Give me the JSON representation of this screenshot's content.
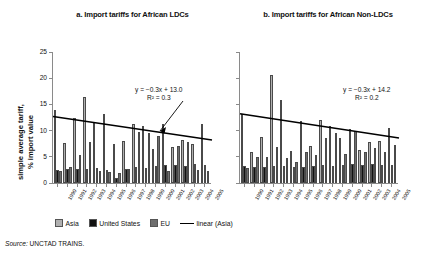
{
  "figure": {
    "ylabel": "simple average tariff,\n% import value",
    "ylabel_line1": "simple average tariff,",
    "ylabel_line2": "% import value",
    "source_prefix": "Source:",
    "source_text": "UNCTAD TRAINS."
  },
  "legend": {
    "items": [
      {
        "label": "Asia",
        "color": "#b0b0b0",
        "type": "swatch",
        "name": "legend-asia"
      },
      {
        "label": "United States",
        "color": "#111111",
        "type": "swatch",
        "name": "legend-united-states"
      },
      {
        "label": "EU",
        "color": "#6e6e6e",
        "type": "swatch",
        "name": "legend-eu"
      },
      {
        "label": "linear (Asia)",
        "color": "#000000",
        "type": "line",
        "name": "legend-linear-asia"
      }
    ]
  },
  "chart_data": [
    {
      "type": "bar",
      "id": "panel-a",
      "title": "a. Import tariffs for African LDCs",
      "xlabel": "",
      "ylabel": "simple average tariff, % import value",
      "ylim": [
        0,
        25
      ],
      "yticks": [
        0,
        5,
        10,
        15,
        20,
        25
      ],
      "ytick_labels": [
        "0",
        "5",
        "10",
        "15",
        "20",
        "25"
      ],
      "grid": false,
      "legend_position": "below-figure",
      "categories": [
        "1990",
        "1991",
        "1992",
        "1993",
        "1994",
        "1995",
        "1996",
        "1997",
        "1998",
        "1999",
        "2000",
        "2001",
        "2002",
        "2003",
        "2004",
        "2005"
      ],
      "series": [
        {
          "name": "Asia",
          "color": "#b0b0b0",
          "values": [
            14.0,
            7.7,
            12.5,
            16.5,
            11.5,
            13.2,
            7.4,
            8.0,
            11.2,
            10.8,
            6.5,
            11.2,
            6.8,
            8.3,
            7.5,
            11.2
          ]
        },
        {
          "name": "United States",
          "color": "#111111",
          "values": [
            2.5,
            2.7,
            2.7,
            2.6,
            2.9,
            2.5,
            0.9,
            2.6,
            3.0,
            2.8,
            3.2,
            3.5,
            3.4,
            3.3,
            3.7,
            3.4
          ]
        },
        {
          "name": "EU",
          "color": "#6e6e6e",
          "values": [
            2.2,
            3.0,
            5.4,
            7.8,
            2.2,
            2.1,
            2.0,
            2.6,
            9.8,
            9.6,
            8.9,
            2.3,
            7.0,
            7.8,
            2.4,
            2.3
          ]
        }
      ],
      "trendline": {
        "series": "Asia",
        "equation": "y = −0.3x + 13.0",
        "r2": "R² = 0.3",
        "intercept": 13.0,
        "slope": -0.3,
        "y_start": 12.7,
        "y_end": 8.2
      },
      "annotation_left_value": "13.0"
    },
    {
      "type": "bar",
      "id": "panel-b",
      "title": "b. Import tariffs for African Non-LDCs",
      "xlabel": "",
      "ylabel": "",
      "ylim": [
        0,
        25
      ],
      "yticks": [
        0,
        5,
        10,
        15,
        20,
        25
      ],
      "ytick_labels": [
        "",
        "",
        "",
        "",
        "",
        ""
      ],
      "grid": false,
      "legend_position": "below-figure",
      "categories": [
        "1990",
        "1991",
        "1992",
        "1993",
        "1994",
        "1995",
        "1996",
        "1997",
        "1998",
        "1999",
        "2000",
        "2001",
        "2002",
        "2003",
        "2004",
        "2005"
      ],
      "series": [
        {
          "name": "Asia",
          "color": "#b0b0b0",
          "values": [
            13.2,
            6.0,
            8.7,
            20.6,
            15.9,
            6.1,
            11.9,
            7.0,
            12.0,
            10.9,
            8.5,
            10.3,
            6.3,
            7.8,
            8.1,
            10.5
          ]
        },
        {
          "name": "United States",
          "color": "#111111",
          "values": [
            3.2,
            3.0,
            3.1,
            3.2,
            3.2,
            3.0,
            3.1,
            3.2,
            3.4,
            3.3,
            3.5,
            3.6,
            3.4,
            3.6,
            3.5,
            3.4
          ]
        },
        {
          "name": "EU",
          "color": "#6e6e6e",
          "values": [
            2.9,
            4.9,
            5.0,
            6.9,
            4.8,
            4.0,
            6.0,
            5.3,
            8.5,
            9.5,
            5.6,
            10.0,
            6.0,
            6.6,
            5.9,
            7.2
          ]
        }
      ],
      "trendline": {
        "series": "Asia",
        "equation": "y = −0.3x + 14.2",
        "r2": "R² = 0.2",
        "intercept": 14.2,
        "slope": -0.3,
        "y_start": 13.2,
        "y_end": 8.6
      }
    }
  ]
}
